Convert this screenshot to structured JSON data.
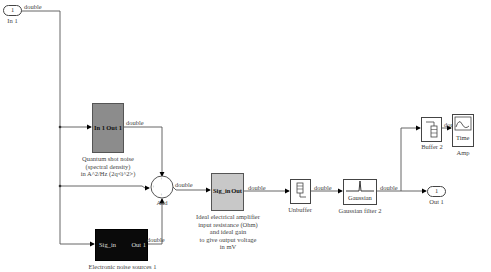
{
  "signal_type": "double",
  "inport": {
    "number": "1",
    "label": "In 1"
  },
  "outport": {
    "number": "1",
    "label": "Out 1"
  },
  "blocks": {
    "quantum": {
      "port_in": "In 1",
      "port_out": "Out 1",
      "caption": [
        "Quantum shot noise",
        "(spectral density)",
        "in A^2/Hz (2q<i^2>)"
      ],
      "fill": "#8c8c8c"
    },
    "electronic": {
      "port_in": "Sig_in",
      "port_out": "Out 1",
      "caption": [
        "Electronic noise sources 1"
      ],
      "fill": "#0a0a0a"
    },
    "sum": {
      "label": "Add",
      "signs": [
        "+",
        "+",
        "+"
      ]
    },
    "amplifier": {
      "port_in": "Sig_in",
      "port_out": "Out",
      "caption": [
        "Ideal electrical amplifier",
        "input resistance (Ohm)",
        "and ideal gain",
        "to give output voltage",
        "in mV"
      ],
      "fill": "#c8c8c8"
    },
    "unbuffer": {
      "caption": [
        "Unbuffer"
      ]
    },
    "gaussian": {
      "inner_label": "Gaussian",
      "caption": [
        "Gaussian filter 2"
      ]
    },
    "buffer": {
      "caption": [
        "Buffer 2"
      ]
    },
    "scope": {
      "inner_label": "Time",
      "caption": [
        "Amp"
      ]
    }
  }
}
